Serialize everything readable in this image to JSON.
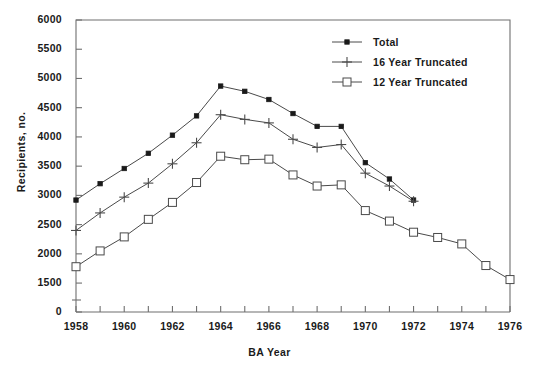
{
  "chart_data": {
    "type": "line",
    "title": "",
    "xlabel": "BA Year",
    "ylabel": "Recipients, no.",
    "x": [
      1958,
      1959,
      1960,
      1961,
      1962,
      1963,
      1964,
      1965,
      1966,
      1967,
      1968,
      1969,
      1970,
      1971,
      1972,
      1973,
      1974,
      1975,
      1976
    ],
    "xlim": [
      1958,
      1976
    ],
    "ylim": [
      1450,
      6000
    ],
    "y_axis_break": true,
    "y_zero_label": "0",
    "xticks_major": [
      1958,
      1960,
      1962,
      1964,
      1966,
      1968,
      1970,
      1972,
      1974,
      1976
    ],
    "xticks_minor_every": 1,
    "yticks": [
      1500,
      2000,
      2500,
      3000,
      3500,
      4000,
      4500,
      5000,
      5500,
      6000
    ],
    "grid": false,
    "legend_position": "top-right",
    "series": [
      {
        "name": "Total",
        "marker": "filled-square",
        "x": [
          1958,
          1959,
          1960,
          1961,
          1962,
          1963,
          1964,
          1965,
          1966,
          1967,
          1968,
          1969,
          1970,
          1971,
          1972
        ],
        "values": [
          2920,
          3200,
          3460,
          3720,
          4030,
          4360,
          4870,
          4780,
          4640,
          4400,
          4180,
          4180,
          3560,
          3280,
          2920
        ]
      },
      {
        "name": "16 Year Truncated",
        "marker": "plus",
        "x": [
          1958,
          1959,
          1960,
          1961,
          1962,
          1963,
          1964,
          1965,
          1966,
          1967,
          1968,
          1969,
          1970,
          1971,
          1972
        ],
        "values": [
          2400,
          2700,
          2970,
          3210,
          3540,
          3900,
          4380,
          4300,
          4240,
          3960,
          3820,
          3870,
          3380,
          3160,
          2900
        ]
      },
      {
        "name": "12 Year Truncated",
        "marker": "open-square",
        "x": [
          1958,
          1959,
          1960,
          1961,
          1962,
          1963,
          1964,
          1965,
          1966,
          1967,
          1968,
          1969,
          1970,
          1971,
          1972,
          1973,
          1974,
          1975,
          1976
        ],
        "values": [
          1780,
          2050,
          2290,
          2590,
          2880,
          3220,
          3670,
          3610,
          3620,
          3350,
          3160,
          3180,
          2740,
          2560,
          2370,
          2280,
          2170,
          1800,
          1560
        ]
      }
    ]
  },
  "axes": {
    "ylabel": "Recipients, no.",
    "xlabel": "BA Year",
    "ytick_labels": [
      "6000",
      "5500",
      "5000",
      "4500",
      "4000",
      "3500",
      "3000",
      "2500",
      "2000",
      "1500",
      "0"
    ],
    "xtick_labels": [
      "1958",
      "1960",
      "1962",
      "1964",
      "1966",
      "1968",
      "1970",
      "1972",
      "1974",
      "1976"
    ]
  },
  "legend": {
    "items": [
      {
        "label": "Total",
        "marker": "filled-square"
      },
      {
        "label": "16 Year Truncated",
        "marker": "plus"
      },
      {
        "label": "12 Year Truncated",
        "marker": "open-square"
      }
    ]
  },
  "colors": {
    "ink": "#1a1a1a",
    "axis": "#6f6f6f",
    "line": "#4a4a4a",
    "background": "#ffffff"
  }
}
